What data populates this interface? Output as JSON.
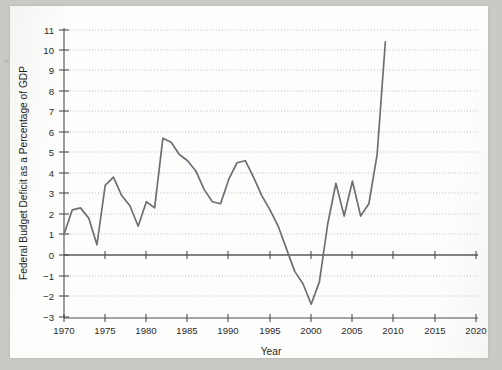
{
  "chart_data": {
    "type": "line",
    "title": "",
    "xlabel": "Year",
    "ylabel": "Federal Budget Deficit as a Percentage of GDP",
    "xlim": [
      1970,
      2021
    ],
    "ylim": [
      -3,
      11
    ],
    "xticks": [
      1970,
      1975,
      1980,
      1985,
      1990,
      1995,
      2000,
      2005,
      2010,
      2015,
      2020
    ],
    "xticklabels": [
      "1970",
      "1975",
      "1980",
      "1985",
      "1990",
      "1995",
      "2000",
      "2005",
      "2010",
      "2015",
      "2020"
    ],
    "yticks": [
      -3,
      -2,
      -1,
      0,
      1,
      2,
      3,
      4,
      5,
      6,
      7,
      8,
      9,
      10,
      11
    ],
    "yticklabels": [
      "−3",
      "−2",
      "−1",
      "0",
      "1",
      "2",
      "3",
      "4",
      "5",
      "6",
      "7",
      "8",
      "9",
      "10",
      "11"
    ],
    "grid": "horizontal-dotted",
    "legend": "none",
    "zero_reference_line": true,
    "line_color": "#6e6f73",
    "x": [
      1970,
      1971,
      1972,
      1973,
      1974,
      1975,
      1976,
      1977,
      1978,
      1979,
      1980,
      1981,
      1982,
      1983,
      1984,
      1985,
      1986,
      1987,
      1988,
      1989,
      1990,
      1991,
      1992,
      1993,
      1994,
      1995,
      1996,
      1997,
      1998,
      1999,
      2000,
      2001,
      2002,
      2003,
      2004,
      2005,
      2006,
      2007,
      2008,
      2009
    ],
    "values": [
      1.0,
      2.2,
      2.3,
      1.8,
      0.5,
      3.4,
      3.8,
      2.9,
      2.4,
      1.4,
      2.6,
      2.3,
      5.7,
      5.5,
      4.9,
      4.6,
      4.1,
      3.2,
      2.6,
      2.5,
      3.7,
      4.5,
      4.6,
      3.8,
      2.9,
      2.2,
      1.4,
      0.3,
      -0.8,
      -1.4,
      -2.4,
      -1.3,
      1.5,
      3.5,
      1.9,
      3.6,
      1.9,
      2.5,
      4.9,
      10.4
    ],
    "notable_points": {
      "peak_1982": 5.7,
      "trough_1974": 0.5,
      "surplus_min_2000": -2.4,
      "peak_2009": 10.4
    }
  },
  "figure": {
    "y_axis_title": "Federal Budget Deficit as a Percentage of GDP",
    "x_axis_title": "Year"
  }
}
